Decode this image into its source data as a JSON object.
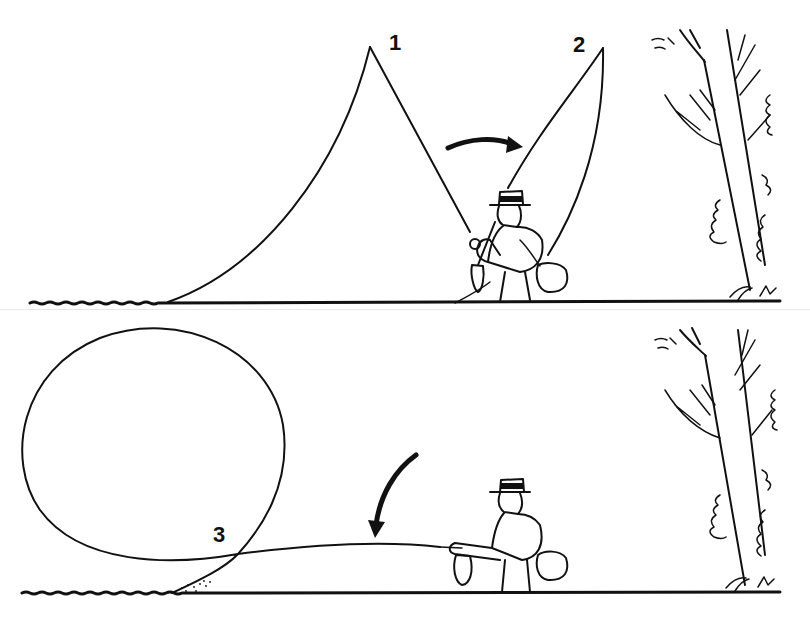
{
  "figure": {
    "type": "fly-casting illustration",
    "panels": [
      {
        "id": "top",
        "description": "Backcast: line loop rising from the water behind to the rod tip (position 1) and forward to position 2",
        "labels": [
          "1",
          "2"
        ],
        "arrow_direction": "clockwise-right"
      },
      {
        "id": "bottom",
        "description": "Roll cast: large circular loop unrolling forward over the water, line crossing at point 3",
        "labels": [
          "3"
        ],
        "arrow_direction": "down-left"
      }
    ]
  },
  "labels": {
    "one": "1",
    "two": "2",
    "three": "3"
  },
  "colors": {
    "ink": "#111111",
    "background": "#ffffff"
  }
}
